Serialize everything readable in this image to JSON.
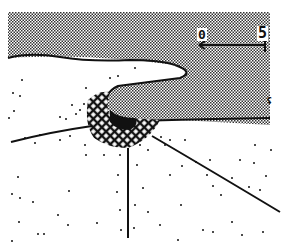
{
  "figure": {
    "type": "schematic drawing"
  },
  "scale_bar": {
    "start_label": "0",
    "end_label": "5"
  },
  "corner_mark": "ʢ",
  "colors": {
    "ink": "#111111",
    "paper": "#ffffff",
    "stipple": "#9a9a9a"
  }
}
